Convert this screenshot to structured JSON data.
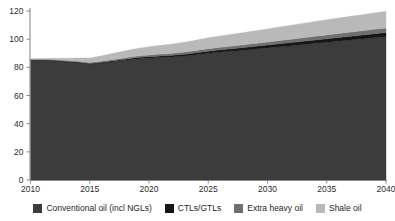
{
  "chart_data": {
    "type": "area",
    "stacked": true,
    "title": "",
    "subtitle": "",
    "xlabel": "",
    "ylabel": "",
    "xlim": [
      2010,
      2040
    ],
    "ylim": [
      0,
      120
    ],
    "ytick_labels": [
      "0",
      "20",
      "40",
      "60",
      "80",
      "100",
      "120"
    ],
    "yticks": [
      0,
      20,
      40,
      60,
      80,
      100,
      120
    ],
    "xtick_labels": [
      "2010",
      "2015",
      "2020",
      "2025",
      "2030",
      "2035",
      "2040"
    ],
    "xticks": [
      2010,
      2015,
      2020,
      2025,
      2030,
      2035,
      2040
    ],
    "grid": false,
    "legend_position": "bottom",
    "x": [
      2010,
      2011,
      2012,
      2013,
      2014,
      2015,
      2016,
      2017,
      2018,
      2019,
      2020,
      2021,
      2022,
      2023,
      2024,
      2025,
      2026,
      2027,
      2028,
      2029,
      2030,
      2031,
      2032,
      2033,
      2034,
      2035,
      2036,
      2037,
      2038,
      2039,
      2040
    ],
    "series": [
      {
        "name": "Conventional oil (incl NGLs)",
        "color": "#3c3c3c",
        "values": [
          85.0,
          85.0,
          84.6,
          84.0,
          83.2,
          82.2,
          83.0,
          84.0,
          85.0,
          86.0,
          86.6,
          87.0,
          87.4,
          88.0,
          89.0,
          90.0,
          90.8,
          91.5,
          92.2,
          93.0,
          93.8,
          94.6,
          95.4,
          96.2,
          97.0,
          97.8,
          98.6,
          99.4,
          100.2,
          101.0,
          101.8
        ]
      },
      {
        "name": "CTLs/GTLs",
        "color": "#161616",
        "values": [
          0.3,
          0.3,
          0.4,
          0.4,
          0.5,
          0.5,
          0.6,
          0.7,
          0.8,
          0.9,
          1.0,
          1.1,
          1.2,
          1.3,
          1.4,
          1.5,
          1.6,
          1.7,
          1.8,
          1.9,
          2.0,
          2.1,
          2.2,
          2.3,
          2.4,
          2.5,
          2.6,
          2.7,
          2.8,
          2.9,
          3.0
        ]
      },
      {
        "name": "Extra heavy oil",
        "color": "#6f6f6f",
        "values": [
          0.4,
          0.4,
          0.5,
          0.5,
          0.6,
          0.7,
          0.8,
          0.9,
          1.0,
          1.1,
          1.2,
          1.3,
          1.4,
          1.5,
          1.6,
          1.7,
          1.8,
          1.9,
          2.0,
          2.1,
          2.2,
          2.3,
          2.4,
          2.5,
          2.6,
          2.7,
          2.8,
          2.9,
          3.0,
          3.1,
          3.2
        ]
      },
      {
        "name": "Shale oil",
        "color": "#b9b9b9",
        "values": [
          0.3,
          0.5,
          1.0,
          1.6,
          2.4,
          3.2,
          3.8,
          4.4,
          5.0,
          5.4,
          5.8,
          6.2,
          6.6,
          7.0,
          7.4,
          7.8,
          8.1,
          8.4,
          8.7,
          9.0,
          9.3,
          9.6,
          9.9,
          10.2,
          10.5,
          10.8,
          11.0,
          11.2,
          11.4,
          11.6,
          11.8
        ]
      }
    ],
    "totals": [
      86.0,
      86.2,
      86.5,
      86.5,
      86.7,
      86.6,
      88.2,
      90.0,
      91.8,
      93.4,
      94.6,
      95.6,
      96.6,
      97.8,
      99.4,
      101.0,
      102.3,
      103.5,
      104.7,
      106.0,
      107.3,
      108.6,
      109.9,
      111.2,
      112.5,
      113.8,
      115.0,
      116.2,
      117.4,
      118.6,
      119.8
    ]
  },
  "legend": {
    "items": [
      {
        "label": "Conventional oil (incl NGLs)",
        "color": "#3c3c3c"
      },
      {
        "label": "CTLs/GTLs",
        "color": "#161616"
      },
      {
        "label": "Extra heavy oil",
        "color": "#6f6f6f"
      },
      {
        "label": "Shale oil",
        "color": "#b9b9b9"
      }
    ]
  }
}
